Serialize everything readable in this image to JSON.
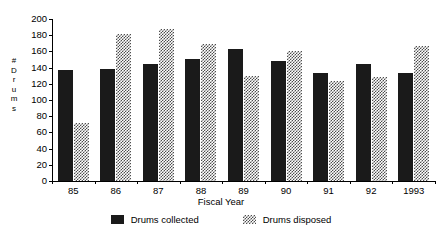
{
  "chart_data": {
    "type": "bar",
    "title": "",
    "xlabel": "Fiscal Year",
    "ylabel": "# Drums",
    "ylabel_chars": [
      "#",
      "D",
      "r",
      "u",
      "m",
      "s"
    ],
    "categories": [
      "85",
      "86",
      "87",
      "88",
      "89",
      "90",
      "91",
      "92",
      "1993"
    ],
    "series": [
      {
        "name": "Drums collected",
        "color": "#1a1a1a",
        "pattern": "solid",
        "values": [
          137,
          138,
          144,
          151,
          163,
          148,
          133,
          145,
          133
        ]
      },
      {
        "name": "Drums disposed",
        "color": "#4d4d4d",
        "pattern": "checkerboard-dither",
        "values": [
          72,
          181,
          188,
          169,
          130,
          161,
          124,
          129,
          167
        ]
      }
    ],
    "ylim": [
      0,
      200
    ],
    "yticks": [
      0,
      20,
      40,
      60,
      80,
      100,
      120,
      140,
      160,
      180,
      200
    ],
    "ytick_labels": [
      "0",
      "20",
      "40",
      "60",
      "80",
      "100",
      "120",
      "140",
      "160",
      "180",
      "200"
    ],
    "grid": false,
    "legend_position": "bottom"
  },
  "legend": {
    "items": [
      {
        "label": "Drums collected",
        "swatch": "collected"
      },
      {
        "label": "Drums disposed",
        "swatch": "disposed"
      }
    ]
  }
}
